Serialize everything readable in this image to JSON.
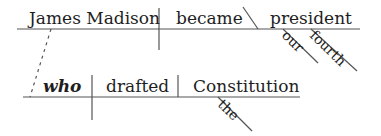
{
  "diagram": {
    "type": "sentence-diagram",
    "main_clause": {
      "subject": "James Madison",
      "verb": "became",
      "predicate_noun": "president",
      "modifiers": [
        "our",
        "fourth"
      ]
    },
    "relative_clause": {
      "subject": "who",
      "verb": "drafted",
      "object": "Constitution",
      "modifiers": [
        "the"
      ]
    }
  }
}
